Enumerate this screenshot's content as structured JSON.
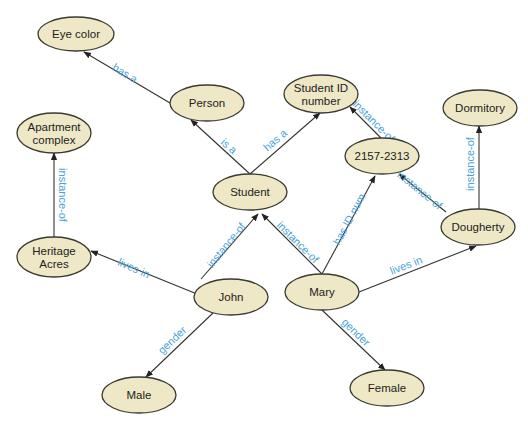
{
  "diagram": {
    "type": "semantic-network",
    "colors": {
      "node_fill": "#efe8c6",
      "node_stroke": "#3a3a32",
      "edge": "#333333",
      "edge_label": "#4aa3d8",
      "background": "#ffffff"
    },
    "nodes": [
      {
        "id": "eye_color",
        "lines": [
          "Eye color"
        ],
        "cx": 76,
        "cy": 34,
        "rx": 38,
        "ry": 17
      },
      {
        "id": "person",
        "lines": [
          "Person"
        ],
        "cx": 207,
        "cy": 103,
        "rx": 37,
        "ry": 18
      },
      {
        "id": "apartment_complex",
        "lines": [
          "Apartment",
          "complex"
        ],
        "cx": 54,
        "cy": 133,
        "rx": 37,
        "ry": 20
      },
      {
        "id": "student_id_number",
        "lines": [
          "Student ID",
          "number"
        ],
        "cx": 321,
        "cy": 94,
        "rx": 37,
        "ry": 19
      },
      {
        "id": "dormitory",
        "lines": [
          "Dormitory"
        ],
        "cx": 480,
        "cy": 108,
        "rx": 37,
        "ry": 18
      },
      {
        "id": "id_value",
        "lines": [
          "2157-2313"
        ],
        "cx": 382,
        "cy": 156,
        "rx": 37,
        "ry": 18
      },
      {
        "id": "student",
        "lines": [
          "Student"
        ],
        "cx": 250,
        "cy": 192,
        "rx": 37,
        "ry": 18
      },
      {
        "id": "heritage_acres",
        "lines": [
          "Heritage",
          "Acres"
        ],
        "cx": 54,
        "cy": 257,
        "rx": 37,
        "ry": 20
      },
      {
        "id": "dougherty",
        "lines": [
          "Dougherty"
        ],
        "cx": 478,
        "cy": 227,
        "rx": 37,
        "ry": 18
      },
      {
        "id": "john",
        "lines": [
          "John"
        ],
        "cx": 231,
        "cy": 297,
        "rx": 37,
        "ry": 18
      },
      {
        "id": "mary",
        "lines": [
          "Mary"
        ],
        "cx": 322,
        "cy": 292,
        "rx": 37,
        "ry": 18
      },
      {
        "id": "male",
        "lines": [
          "Male"
        ],
        "cx": 139,
        "cy": 395,
        "rx": 37,
        "ry": 18
      },
      {
        "id": "female",
        "lines": [
          "Female"
        ],
        "cx": 387,
        "cy": 388,
        "rx": 37,
        "ry": 18
      }
    ],
    "edges": [
      {
        "from": "person",
        "to": "eye_color",
        "label": "has a",
        "x1": 170,
        "y1": 103,
        "x2": 84,
        "y2": 52,
        "lx": 125,
        "ly": 73,
        "angle": 31,
        "loff": -8
      },
      {
        "from": "student",
        "to": "person",
        "label": "is a",
        "x1": 250,
        "y1": 174,
        "x2": 191,
        "y2": 120,
        "lx": 229,
        "ly": 146,
        "angle": 42,
        "loff": -8
      },
      {
        "from": "student",
        "to": "student_id_number",
        "label": "has a",
        "x1": 250,
        "y1": 174,
        "x2": 320,
        "y2": 113,
        "lx": 275,
        "ly": 140,
        "angle": -41,
        "loff": -8
      },
      {
        "from": "id_value",
        "to": "student_id_number",
        "label": "instance-of",
        "x1": 381,
        "y1": 138,
        "x2": 350,
        "y2": 107,
        "lx": 374,
        "ly": 121,
        "angle": 45,
        "loff": -8
      },
      {
        "from": "heritage_acres",
        "to": "apartment_complex",
        "label": "instance-of",
        "x1": 54,
        "y1": 237,
        "x2": 54,
        "y2": 153,
        "lx": 63,
        "ly": 195,
        "angle": 90,
        "loff": 0
      },
      {
        "from": "dougherty",
        "to": "dormitory",
        "label": "instance-of",
        "x1": 479,
        "y1": 209,
        "x2": 479,
        "y2": 126,
        "lx": 470,
        "ly": 164,
        "angle": -90,
        "loff": 0
      },
      {
        "from": "dougherty",
        "to": "id_value",
        "label": "instance-of",
        "x1": 446,
        "y1": 212,
        "x2": 399,
        "y2": 174,
        "lx": 420,
        "ly": 190,
        "angle": 39,
        "loff": -8
      },
      {
        "from": "john",
        "to": "heritage_acres",
        "label": "lives in",
        "x1": 197,
        "y1": 294,
        "x2": 91,
        "y2": 251,
        "lx": 134,
        "ly": 268,
        "angle": 24,
        "loff": -8
      },
      {
        "from": "john",
        "to": "student",
        "label": "instance-of",
        "x1": 201,
        "y1": 279,
        "x2": 258,
        "y2": 214,
        "lx": 226,
        "ly": 245,
        "angle": -51,
        "loff": -8
      },
      {
        "from": "mary",
        "to": "student",
        "label": "instance-of",
        "x1": 322,
        "y1": 274,
        "x2": 262,
        "y2": 214,
        "lx": 298,
        "ly": 242,
        "angle": 45,
        "loff": -8
      },
      {
        "from": "mary",
        "to": "id_value",
        "label": "has ID num",
        "x1": 322,
        "y1": 274,
        "x2": 375,
        "y2": 176,
        "lx": 349,
        "ly": 219,
        "angle": -62,
        "loff": -8
      },
      {
        "from": "mary",
        "to": "dougherty",
        "label": "lives in",
        "x1": 359,
        "y1": 292,
        "x2": 476,
        "y2": 246,
        "lx": 406,
        "ly": 265,
        "angle": -21,
        "loff": -8
      },
      {
        "from": "john",
        "to": "male",
        "label": "gender",
        "x1": 213,
        "y1": 313,
        "x2": 146,
        "y2": 377,
        "lx": 172,
        "ly": 340,
        "angle": -44,
        "loff": -8
      },
      {
        "from": "mary",
        "to": "female",
        "label": "gender",
        "x1": 322,
        "y1": 310,
        "x2": 385,
        "y2": 370,
        "lx": 356,
        "ly": 332,
        "angle": 44,
        "loff": -8
      }
    ]
  }
}
